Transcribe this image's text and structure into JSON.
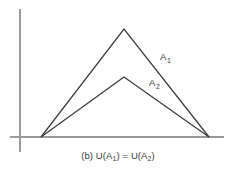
{
  "figure": {
    "caption_prefix": "(b)",
    "caption_full": "(b) U(A1) = U(A2)",
    "background_color": "#ffffff",
    "axis_color": "#9a9a9a",
    "line_color": "#3b3b3b",
    "text_color": "#3a3a3a"
  },
  "caption": {
    "label": "(b) ",
    "u_open_1": "U(A",
    "sub_1": "1",
    "close_eq": ") = U(A",
    "sub_2": "2",
    "close_2": ")"
  },
  "labels": {
    "a1_base": "A",
    "a1_sub": "1",
    "a2_base": "A",
    "a2_sub": "2"
  },
  "chart_data": {
    "type": "line",
    "title": "",
    "subtitle": "",
    "xlabel": "",
    "ylabel": "",
    "annotation": "(b) U(A1) = U(A2)",
    "grid": false,
    "legend_position": "inline-right",
    "axes": {
      "x_axis_visible": true,
      "y_axis_visible": true,
      "x_axis_y_pixel": 137,
      "y_axis_x_pixel": 20,
      "x_axis_span_pixels": [
        10,
        224
      ],
      "y_axis_span_pixels": [
        9,
        152
      ],
      "ticks": [],
      "tick_labels": []
    },
    "xlim": [
      0,
      1
    ],
    "ylim": [
      0,
      1
    ],
    "series": [
      {
        "name": "A1",
        "label": "A1",
        "color": "#3b3b3b",
        "points_px": [
          [
            41,
            137
          ],
          [
            124,
            29
          ],
          [
            209,
            137
          ]
        ],
        "x": [
          0.145,
          0.533,
          0.93
        ],
        "y": [
          0.0,
          1.0,
          0.0
        ],
        "peak_height": 1.0,
        "label_px": [
          160,
          60
        ]
      },
      {
        "name": "A2",
        "label": "A2",
        "color": "#3b3b3b",
        "points_px": [
          [
            41,
            137
          ],
          [
            124,
            77
          ],
          [
            209,
            137
          ]
        ],
        "x": [
          0.145,
          0.533,
          0.93
        ],
        "y": [
          0.0,
          0.556,
          0.0
        ],
        "peak_height": 0.556,
        "label_px": [
          149,
          86
        ]
      }
    ]
  }
}
